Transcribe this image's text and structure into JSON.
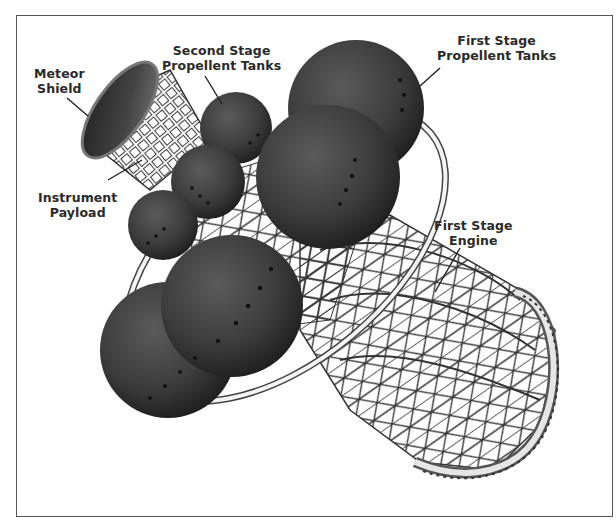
{
  "figure": {
    "labels": [
      {
        "id": "meteor-shield",
        "line1": "Meteor",
        "line2": "Shield"
      },
      {
        "id": "instrument-payload",
        "line1": "Instrument",
        "line2": "Payload"
      },
      {
        "id": "second-stage-tanks",
        "line1": "Second Stage",
        "line2": "Propellent Tanks"
      },
      {
        "id": "first-stage-tanks",
        "line1": "First Stage",
        "line2": "Propellent Tanks"
      },
      {
        "id": "first-stage-engine",
        "line1": "First Stage",
        "line2": "Engine"
      }
    ]
  },
  "colors": {
    "border": "#555555",
    "tank": "#3c3c3c",
    "tank_shadow": "#1e1e1e",
    "truss": "#333333",
    "label_text": "#2a2a2a"
  }
}
